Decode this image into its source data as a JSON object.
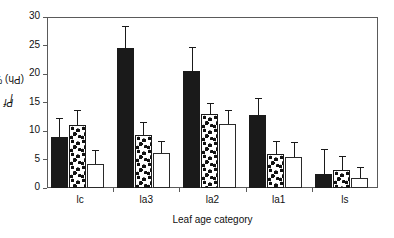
{
  "chart_data": {
    "type": "bar",
    "title": "",
    "xlabel": "Leaf age category",
    "ylabel": "Pfl(Ph) %",
    "ylabel_parts": {
      "prefix": "Pf",
      "sub": "l",
      "suffix": "(Ph) %"
    },
    "categories": [
      "lc",
      "la3",
      "la2",
      "la1",
      "ls"
    ],
    "ylim": [
      0,
      30
    ],
    "yticks": [
      0,
      5,
      10,
      15,
      20,
      25,
      30
    ],
    "ytick_labels": [
      "0",
      "5",
      "10",
      "15",
      "20",
      "25",
      "30"
    ],
    "grid": false,
    "legend": "none",
    "error_bars": "upper only",
    "series": [
      {
        "name": "solid-black",
        "fill": "solid black",
        "color": "#1a1a1a",
        "values": [
          9.0,
          24.5,
          20.5,
          12.8,
          2.5
        ],
        "errors": [
          3.3,
          4.0,
          4.3,
          3.0,
          4.3
        ]
      },
      {
        "name": "dotted",
        "fill": "dotted pattern",
        "color": "#ffffff",
        "values": [
          11.0,
          9.3,
          13.0,
          6.0,
          3.1
        ],
        "errors": [
          2.6,
          2.2,
          2.0,
          2.3,
          2.6
        ]
      },
      {
        "name": "open-white",
        "fill": "open white",
        "color": "#ffffff",
        "values": [
          4.2,
          6.2,
          11.3,
          5.5,
          1.8
        ],
        "errors": [
          2.5,
          2.0,
          2.3,
          2.5,
          1.8
        ]
      }
    ]
  },
  "axis": {
    "y_title": "Pfl(Ph) %",
    "x_title": "Leaf age category"
  }
}
